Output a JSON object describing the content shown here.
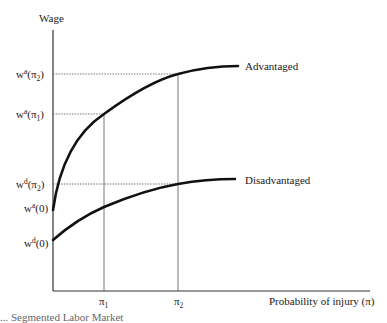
{
  "diagram": {
    "y_axis_label": "Wage",
    "x_axis_label": "Probability of injury (π)",
    "x_ticks": [
      {
        "symbol": "π",
        "sub": "1"
      },
      {
        "symbol": "π",
        "sub": "2"
      }
    ],
    "y_ticks": [
      {
        "base": "w",
        "sup": "a",
        "arg": "(π",
        "argsub": "2",
        "close": ")"
      },
      {
        "base": "w",
        "sup": "a",
        "arg": "(π",
        "argsub": "1",
        "close": ")"
      },
      {
        "base": "w",
        "sup": "d",
        "arg": "(π",
        "argsub": "2",
        "close": ")"
      },
      {
        "base": "w",
        "sup": "a",
        "arg": "(0)",
        "argsub": "",
        "close": ""
      },
      {
        "base": "w",
        "sup": "d",
        "arg": "(0)",
        "argsub": "",
        "close": ""
      }
    ],
    "curves": [
      {
        "name": "Advantaged",
        "label": "Advantaged"
      },
      {
        "name": "Disadvantaged",
        "label": "Disadvantaged"
      }
    ],
    "colors": {
      "curve": "#111111",
      "axis": "#333333",
      "guide": "#555555"
    }
  },
  "caption": "... Segmented Labor Market"
}
